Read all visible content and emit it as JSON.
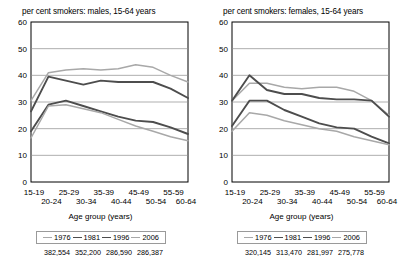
{
  "figure": {
    "axis_caption": "Age group (years)",
    "panels": [
      "males",
      "females"
    ]
  },
  "chart_data": [
    {
      "type": "line",
      "title": "per cent smokers: males, 15-64 years",
      "xlabel": "Age group (years)",
      "ylabel": "",
      "categories": [
        "15-19",
        "20-24",
        "25-29",
        "30-34",
        "35-39",
        "40-44",
        "45-49",
        "50-54",
        "55-59",
        "60-64"
      ],
      "ylim": [
        0,
        60
      ],
      "yticks": [
        0,
        10,
        20,
        30,
        40,
        50,
        60
      ],
      "grid": true,
      "legend_position": "bottom",
      "series": [
        {
          "name": "1976",
          "color": "#a8a8a8",
          "values": [
            30.5,
            41.0,
            42.0,
            42.5,
            42.0,
            42.5,
            44.0,
            43.0,
            40.0,
            37.5
          ]
        },
        {
          "name": "1981",
          "color": "#4d4d4d",
          "values": [
            26.5,
            39.5,
            38.0,
            36.5,
            38.0,
            37.5,
            37.5,
            37.5,
            35.0,
            31.5
          ]
        },
        {
          "name": "1996",
          "color": "#4d4d4d",
          "values": [
            19.0,
            29.0,
            30.5,
            28.5,
            26.5,
            24.5,
            23.0,
            22.5,
            20.5,
            18.0
          ]
        },
        {
          "name": "2006",
          "color": "#a8a8a8",
          "values": [
            16.5,
            28.5,
            29.0,
            27.5,
            26.0,
            23.5,
            21.0,
            19.0,
            17.0,
            15.5
          ]
        }
      ],
      "legend_values": [
        "382,554",
        "352,200",
        "286,590",
        "286,387"
      ]
    },
    {
      "type": "line",
      "title": "per cent smokers: females, 15-64 years",
      "xlabel": "Age group (years)",
      "ylabel": "",
      "categories": [
        "15-19",
        "20-24",
        "25-29",
        "30-34",
        "35-39",
        "40-44",
        "45-49",
        "50-54",
        "55-59",
        "60-64"
      ],
      "ylim": [
        0,
        60
      ],
      "yticks": [
        0,
        10,
        20,
        30,
        40,
        50,
        60
      ],
      "grid": true,
      "legend_position": "bottom",
      "series": [
        {
          "name": "1976",
          "color": "#a8a8a8",
          "values": [
            30.5,
            37.0,
            37.0,
            35.5,
            35.0,
            35.5,
            35.5,
            34.0,
            30.5,
            25.0
          ]
        },
        {
          "name": "1981",
          "color": "#4d4d4d",
          "values": [
            30.5,
            40.0,
            34.5,
            33.0,
            33.0,
            31.5,
            31.0,
            31.0,
            30.5,
            24.5
          ]
        },
        {
          "name": "1996",
          "color": "#4d4d4d",
          "values": [
            21.0,
            30.5,
            30.5,
            27.0,
            24.5,
            22.0,
            20.5,
            20.0,
            17.0,
            14.5
          ]
        },
        {
          "name": "2006",
          "color": "#a8a8a8",
          "values": [
            19.0,
            26.0,
            25.0,
            23.0,
            21.5,
            20.0,
            19.0,
            17.0,
            15.5,
            14.0
          ]
        }
      ],
      "legend_values": [
        "320,145",
        "313,470",
        "281,997",
        "275,778"
      ]
    }
  ]
}
